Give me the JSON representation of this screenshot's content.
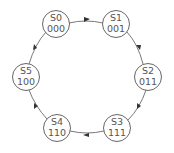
{
  "diagram": {
    "type": "state-machine",
    "nodes": [
      {
        "id": "S0",
        "name": "S0",
        "code": "000",
        "cx": 56,
        "cy": 24
      },
      {
        "id": "S1",
        "name": "S1",
        "code": "001",
        "cx": 116,
        "cy": 24
      },
      {
        "id": "S2",
        "name": "S2",
        "code": "011",
        "cx": 148,
        "cy": 77
      },
      {
        "id": "S3",
        "name": "S3",
        "code": "111",
        "cx": 117,
        "cy": 128
      },
      {
        "id": "S4",
        "name": "S4",
        "code": "110",
        "cx": 57,
        "cy": 128
      },
      {
        "id": "S5",
        "name": "S5",
        "code": "100",
        "cx": 26,
        "cy": 77
      }
    ],
    "edges": [
      {
        "from": "S0",
        "to": "S1"
      },
      {
        "from": "S1",
        "to": "S2"
      },
      {
        "from": "S2",
        "to": "S3"
      },
      {
        "from": "S3",
        "to": "S4"
      },
      {
        "from": "S4",
        "to": "S5"
      },
      {
        "from": "S5",
        "to": "S0"
      }
    ],
    "stroke_color": "#555555"
  }
}
